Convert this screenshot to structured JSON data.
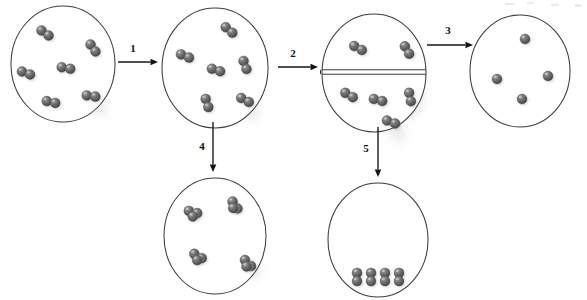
{
  "diagram": {
    "background_color": "#ffffff",
    "atom_color": "#5a5a5a",
    "atom_highlight_color": "#b0b0b0",
    "outline_color": "#3c3c3c",
    "arrow_color": "#141414"
  },
  "arrows": [
    {
      "id": "arrow-1",
      "label": "1",
      "direction": "right",
      "from": "vessel-initial",
      "to": "vessel-expanded",
      "x1": 118,
      "y1": 62,
      "x2": 158,
      "y2": 62,
      "label_x": 133,
      "label_y": 52
    },
    {
      "id": "arrow-2",
      "label": "2",
      "direction": "right",
      "from": "vessel-expanded",
      "to": "vessel-partitioned",
      "x1": 278,
      "y1": 67,
      "x2": 318,
      "y2": 67,
      "label_x": 293,
      "label_y": 57
    },
    {
      "id": "arrow-3",
      "label": "3",
      "direction": "right",
      "from": "vessel-partitioned",
      "to": "vessel-dissociated",
      "x1": 427,
      "y1": 45,
      "x2": 473,
      "y2": 45,
      "label_x": 448,
      "label_y": 34
    },
    {
      "id": "arrow-4",
      "label": "4",
      "direction": "down",
      "from": "vessel-expanded",
      "to": "vessel-trimers",
      "x1": 213,
      "y1": 122,
      "x2": 213,
      "y2": 172,
      "label_x": 202,
      "label_y": 150
    },
    {
      "id": "arrow-5",
      "label": "5",
      "direction": "down",
      "from": "vessel-partitioned",
      "to": "vessel-condensed",
      "x1": 378,
      "y1": 127,
      "x2": 378,
      "y2": 177,
      "label_x": 366,
      "label_y": 152
    }
  ],
  "vessels": [
    {
      "id": "vessel-initial",
      "name": "initial-gas-container",
      "cx": 63,
      "cy": 64,
      "rx": 52,
      "ry": 58,
      "partitioned": false,
      "species": "diatomic",
      "particle_count": 6,
      "molecules": [
        {
          "x": 45,
          "y": 33,
          "angle": 35
        },
        {
          "x": 93,
          "y": 48,
          "angle": 55
        },
        {
          "x": 66,
          "y": 68,
          "angle": 10
        },
        {
          "x": 26,
          "y": 73,
          "angle": 20
        },
        {
          "x": 51,
          "y": 102,
          "angle": 12
        },
        {
          "x": 91,
          "y": 96,
          "angle": 8
        }
      ]
    },
    {
      "id": "vessel-expanded",
      "name": "expanded-gas-container",
      "cx": 215,
      "cy": 68,
      "rx": 53,
      "ry": 60,
      "partitioned": false,
      "species": "diatomic",
      "particle_count": 6,
      "molecules": [
        {
          "x": 229,
          "y": 30,
          "angle": 40
        },
        {
          "x": 185,
          "y": 56,
          "angle": 22
        },
        {
          "x": 216,
          "y": 70,
          "angle": 18
        },
        {
          "x": 245,
          "y": 65,
          "angle": 70
        },
        {
          "x": 207,
          "y": 103,
          "angle": 72
        },
        {
          "x": 245,
          "y": 100,
          "angle": 28
        }
      ]
    },
    {
      "id": "vessel-partitioned",
      "name": "partitioned-container",
      "cx": 374,
      "cy": 73,
      "rx": 52,
      "ry": 59,
      "partitioned": true,
      "partition_y": 72,
      "species": "diatomic",
      "particle_count": 6,
      "upper_count": 2,
      "lower_count": 4,
      "molecules": [
        {
          "x": 358,
          "y": 48,
          "angle": 28
        },
        {
          "x": 407,
          "y": 50,
          "angle": 60
        },
        {
          "x": 349,
          "y": 95,
          "angle": 30
        },
        {
          "x": 378,
          "y": 100,
          "angle": 14
        },
        {
          "x": 410,
          "y": 97,
          "angle": 78
        },
        {
          "x": 391,
          "y": 122,
          "angle": 20
        }
      ]
    },
    {
      "id": "vessel-dissociated",
      "name": "dissociated-atoms-container",
      "cx": 520,
      "cy": 71,
      "rx": 50,
      "ry": 56,
      "partitioned": false,
      "species": "monatomic",
      "particle_count": 4,
      "molecules": [
        {
          "x": 525,
          "y": 39,
          "angle": 0
        },
        {
          "x": 497,
          "y": 79,
          "angle": 0
        },
        {
          "x": 548,
          "y": 76,
          "angle": 0
        },
        {
          "x": 522,
          "y": 99,
          "angle": 0
        }
      ]
    },
    {
      "id": "vessel-trimers",
      "name": "triatomic-cluster-container",
      "cx": 215,
      "cy": 236,
      "rx": 51,
      "ry": 58,
      "partitioned": false,
      "species": "triatomic",
      "particle_count": 4,
      "molecules": [
        {
          "x": 193,
          "y": 212,
          "angle": 15
        },
        {
          "x": 235,
          "y": 205,
          "angle": 55
        },
        {
          "x": 198,
          "y": 256,
          "angle": 30
        },
        {
          "x": 248,
          "y": 263,
          "angle": 45
        }
      ]
    },
    {
      "id": "vessel-condensed",
      "name": "condensed-phase-container",
      "cx": 378,
      "cy": 240,
      "rx": 50,
      "ry": 57,
      "partitioned": false,
      "species": "diatomic-condensed",
      "particle_count": 4,
      "molecules": [
        {
          "x": 357,
          "y": 277,
          "angle": 90
        },
        {
          "x": 371,
          "y": 277,
          "angle": 90
        },
        {
          "x": 385,
          "y": 277,
          "angle": 90
        },
        {
          "x": 399,
          "y": 277,
          "angle": 90
        }
      ]
    }
  ]
}
